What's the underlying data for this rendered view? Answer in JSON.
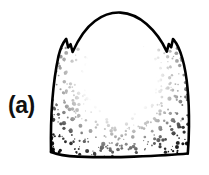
{
  "figure": {
    "panel_label": "(a)",
    "caption_alt": "Stippled line drawing of a dome-shaped sclerite with paired lateral notches",
    "technique": "ink line drawing with stipple shading",
    "colors": {
      "background": "#ffffff",
      "ink": "#000000",
      "label": "#111111",
      "fill": "#ffffff"
    },
    "geometry": {
      "canvas_width": 209,
      "canvas_height": 175,
      "outline_left_x": 51,
      "outline_right_x": 189,
      "outline_top_y": 12,
      "outline_bottom_y": 157,
      "left_notch_x": 66,
      "left_notch_y": 40,
      "right_notch_x": 173,
      "right_notch_y": 40,
      "stroke_width": 2.6
    },
    "shading": {
      "type": "stipple",
      "description": "dense along left, right and bottom margins; sparse to blank in the center",
      "dot_count": 900,
      "dot_min_radius": 0.5,
      "dot_max_radius": 1.9
    },
    "label_position": {
      "x": 8,
      "y": 92
    }
  }
}
